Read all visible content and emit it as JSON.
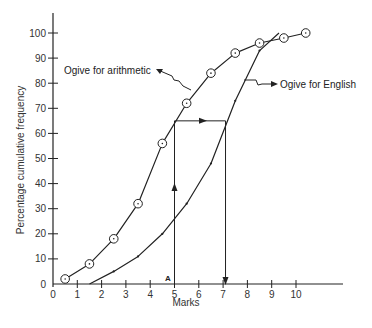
{
  "chart_data": {
    "type": "line",
    "title": "",
    "xlabel": "Marks",
    "ylabel": "Percentage cumulative frequency",
    "xlim": [
      0,
      11.5
    ],
    "ylim": [
      0,
      105
    ],
    "x_ticks": [
      0,
      1,
      2,
      3,
      4,
      5,
      6,
      7,
      8,
      9,
      10
    ],
    "y_ticks": [
      0,
      10,
      20,
      30,
      40,
      50,
      60,
      70,
      80,
      90,
      100
    ],
    "grid": false,
    "legend": null,
    "series": [
      {
        "name": "Ogive for arithmetic",
        "marker": "circle",
        "x": [
          0.5,
          1.5,
          2.5,
          3.5,
          4.5,
          5.5,
          6.5,
          7.5,
          8.5,
          9.5,
          10.4
        ],
        "y": [
          2,
          8,
          18,
          32,
          56,
          72,
          84,
          92,
          96,
          98,
          100
        ]
      },
      {
        "name": "Ogive for English",
        "marker": "dot",
        "x": [
          1.5,
          2.5,
          3.5,
          4.5,
          5.5,
          6.5,
          7.5,
          8.5,
          9.3
        ],
        "y": [
          0,
          5,
          11,
          20,
          32,
          48,
          73,
          93,
          100
        ]
      }
    ],
    "annotations": [
      {
        "type": "label",
        "text": "Ogive for arithmetic",
        "target_series": "Ogive for arithmetic"
      },
      {
        "type": "label",
        "text": "Ogive for English",
        "target_series": "Ogive for English"
      },
      {
        "type": "vertical-line",
        "x": 5,
        "y_from": 0,
        "y_to": 65,
        "arrow": "up",
        "label": "A"
      },
      {
        "type": "horizontal-line",
        "y": 65,
        "x_from": 5,
        "x_to": 7.1,
        "arrow": "right"
      },
      {
        "type": "vertical-line",
        "x": 7.1,
        "y_from": 65,
        "y_to": 0,
        "arrow": "down"
      }
    ]
  },
  "labels": {
    "arithmetic": "Ogive for arithmetic",
    "english": "Ogive for English",
    "point_a": "A",
    "xlabel": "Marks",
    "ylabel": "Percentage cumulative frequency"
  },
  "colors": {
    "ink": "#222222",
    "background": "#ffffff"
  }
}
